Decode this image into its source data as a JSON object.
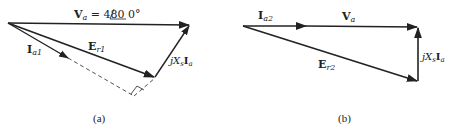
{
  "diagrams": [
    {
      "id": "a",
      "caption": "(a)",
      "vectors": [
        {
          "name": "V_a",
          "label_main": "V",
          "label_sub": "a",
          "label_suffix": " = 480 ",
          "angle_text": "0°"
        },
        {
          "name": "E_r1",
          "label_main": "E",
          "label_sub": "r1"
        },
        {
          "name": "I_a1",
          "label_main": "I",
          "label_sub": "a1"
        },
        {
          "name": "jXsIa",
          "label_j": "j",
          "label_X": "X",
          "label_s": "s",
          "label_I": "I",
          "label_a": "a"
        }
      ]
    },
    {
      "id": "b",
      "caption": "(b)",
      "vectors": [
        {
          "name": "I_a2",
          "label_main": "I",
          "label_sub": "a2"
        },
        {
          "name": "V_a",
          "label_main": "V",
          "label_sub": "a"
        },
        {
          "name": "E_r2",
          "label_main": "E",
          "label_sub": "r2"
        },
        {
          "name": "jXsIa",
          "label_j": "j",
          "label_X": "X",
          "label_s": "s",
          "label_I": "I",
          "label_a": "a"
        }
      ]
    }
  ],
  "colors": {
    "stroke": "#222222",
    "background": "#ffffff"
  }
}
